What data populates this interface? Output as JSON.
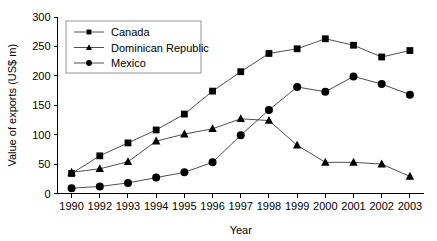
{
  "chart_data": {
    "type": "line",
    "title": "",
    "xlabel": "Year",
    "ylabel": "Value of exports (US$ m)",
    "categories": [
      "1990",
      "1992",
      "1993",
      "1994",
      "1995",
      "1996",
      "1997",
      "1998",
      "1999",
      "2000",
      "2001",
      "2002",
      "2003"
    ],
    "ylim": [
      0,
      300
    ],
    "yticks": [
      0,
      50,
      100,
      150,
      200,
      250,
      300
    ],
    "ytick_labels": [
      "0",
      "50",
      "100",
      "150",
      "200",
      "250",
      "300"
    ],
    "grid": false,
    "legend_position": "upper-left-inside",
    "series": [
      {
        "name": "Canada",
        "marker": "square",
        "color": "#000000",
        "values": [
          34,
          64,
          86,
          108,
          135,
          174,
          207,
          238,
          246,
          263,
          252,
          232,
          243
        ]
      },
      {
        "name": "Dominican Republic",
        "marker": "triangle",
        "color": "#000000",
        "values": [
          36,
          42,
          54,
          89,
          101,
          110,
          127,
          124,
          82,
          53,
          53,
          50,
          29
        ]
      },
      {
        "name": "Mexico",
        "marker": "circle",
        "color": "#000000",
        "values": [
          9,
          12,
          18,
          27,
          36,
          53,
          99,
          142,
          181,
          173,
          199,
          186,
          168
        ]
      }
    ]
  },
  "axes": {
    "x_axis_label": "Year",
    "y_axis_label": "Value of exports (US$ m)"
  },
  "legend": {
    "entries": [
      {
        "label": "Canada",
        "marker": "square-marker"
      },
      {
        "label": "Dominican Republic",
        "marker": "triangle-marker"
      },
      {
        "label": "Mexico",
        "marker": "circle-marker"
      }
    ]
  }
}
